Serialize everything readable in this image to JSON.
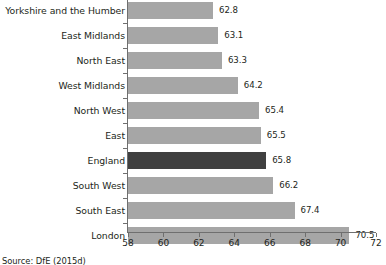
{
  "chart_data": {
    "type": "bar",
    "orientation": "horizontal",
    "title": "",
    "xlabel": "",
    "ylabel": "",
    "categories": [
      "Yorkshire and the Humber",
      "East Midlands",
      "North East",
      "West Midlands",
      "North West",
      "East",
      "England",
      "South West",
      "South East",
      "London"
    ],
    "values": [
      62.8,
      63.1,
      63.3,
      64.2,
      65.4,
      65.5,
      65.8,
      66.2,
      67.4,
      70.5
    ],
    "value_labels": [
      "62.8",
      "63.1",
      "63.3",
      "64.2",
      "65.4",
      "65.5",
      "65.8",
      "66.2",
      "67.4",
      "70.5"
    ],
    "highlighted_category": "England",
    "xlim": [
      58,
      72
    ],
    "xticks": [
      58,
      60,
      62,
      64,
      66,
      68,
      70,
      72
    ],
    "xtick_labels": [
      "58",
      "60",
      "62",
      "64",
      "66",
      "68",
      "70",
      "72"
    ],
    "grid": false,
    "legend": false,
    "colors": {
      "bar": "#a6a6a6",
      "bar_highlight": "#404040",
      "axis": "#6f6f6f",
      "text": "#231f20",
      "background": "#ffffff"
    }
  },
  "source": {
    "text": "Source: DfE (2015d)"
  }
}
